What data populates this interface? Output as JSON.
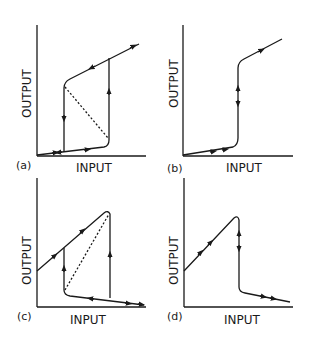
{
  "figure": {
    "panels": [
      {
        "id": "a",
        "label": "(a)",
        "xlabel": "INPUT",
        "ylabel": "OUTPUT",
        "description": "Hysteresis loop: lower branch rises slowly, jumps up at high input; upper branch, drops at low input; dashed unstable branch"
      },
      {
        "id": "b",
        "label": "(b)",
        "xlabel": "INPUT",
        "ylabel": "OUTPUT",
        "description": "Sharp single-valued switching curve with steep vertical rise"
      },
      {
        "id": "c",
        "label": "(c)",
        "xlabel": "INPUT",
        "ylabel": "OUTPUT",
        "description": "Inverted hysteresis: high branch rises with input, drops at high input to low branch; jumps up at low input; dashed unstable branch"
      },
      {
        "id": "d",
        "label": "(d)",
        "xlabel": "INPUT",
        "ylabel": "OUTPUT",
        "description": "Single-valued curve rising then dropping sharply to low branch"
      }
    ]
  }
}
